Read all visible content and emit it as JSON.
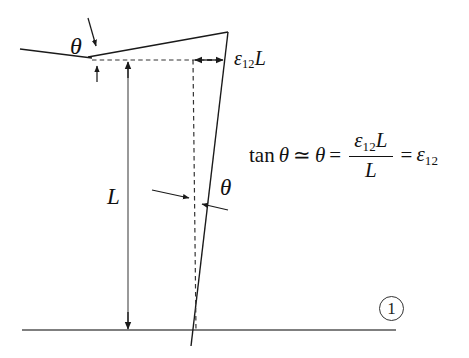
{
  "figure": {
    "background_color": "#ffffff",
    "line_color": "#1a1a1a",
    "labels": {
      "theta_top": "θ",
      "theta_bottom": "θ",
      "length_L": "L",
      "displacement": {
        "epsilon": "ε",
        "subscript": "12",
        "length": "L",
        "full": "ε₁₂L"
      },
      "callout_number": "①"
    },
    "equation": {
      "tan_fn": "tan",
      "theta": "θ",
      "approx": "≃",
      "equals": "=",
      "numerator_epsilon": "ε",
      "numerator_subscript": "12",
      "numerator_length": "L",
      "denominator": "L",
      "result_epsilon": "ε",
      "result_subscript": "12",
      "plain": "tan θ ≃ θ = ε₁₂L / L = ε₁₂"
    },
    "geometry": {
      "baseline_y": 330,
      "baseline_x_start": 22,
      "baseline_x_end": 396,
      "apex_x": 227,
      "apex_y": 32,
      "foot_x": 196,
      "foot_y": 340,
      "dashed_horizontal_y": 60,
      "dashed_vertical_x": 193,
      "dimension_line_x": 128
    }
  }
}
